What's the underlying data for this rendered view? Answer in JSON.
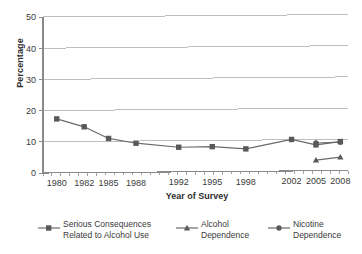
{
  "chart_data": {
    "type": "line",
    "title": "",
    "subtitle": "",
    "xlabel": "Year of Survey",
    "ylabel": "Percentage",
    "categories": [
      "1980",
      "1982",
      "1985",
      "1988",
      "1992",
      "1995",
      "1998",
      "2002",
      "2005",
      "2008"
    ],
    "ylim": [
      0,
      50
    ],
    "yticks": [
      0,
      10,
      20,
      30,
      40,
      50
    ],
    "ytick_labels": [
      "0",
      "10",
      "20",
      "30",
      "40",
      "50"
    ],
    "grid": "horizontal",
    "legend_position": "bottom",
    "series": [
      {
        "name": "Serious Consequences Related to Alcohol Use",
        "marker": "square",
        "color": "#595959",
        "values": [
          17.3,
          14.7,
          10.9,
          9.3,
          7.9,
          8.0,
          7.2,
          10.1,
          8.3,
          9.3
        ]
      },
      {
        "name": "Alcohol Dependence",
        "marker": "triangle",
        "color": "#595959",
        "values": [
          null,
          null,
          null,
          null,
          null,
          null,
          null,
          null,
          3.4,
          4.3
        ]
      },
      {
        "name": "Nicotine Dependence",
        "marker": "circle",
        "color": "#595959",
        "values": [
          null,
          null,
          null,
          null,
          null,
          null,
          null,
          null,
          8.9,
          9.1
        ]
      }
    ]
  },
  "axes": {
    "y_title": "Percentage",
    "x_title": "Year of Survey"
  },
  "legend": {
    "items": [
      {
        "label": "Serious Consequences\nRelated to Alcohol Use",
        "marker": "square-marker"
      },
      {
        "label": "Alcohol\nDependence",
        "marker": "triangle-marker"
      },
      {
        "label": "Nicotine\nDependence",
        "marker": "circle-marker"
      }
    ]
  },
  "colors": {
    "line": "#6b6b6b",
    "marker": "#595959",
    "grid": "#b8b8b8",
    "axis": "#8a8a8a",
    "text": "#3a3a3a"
  }
}
